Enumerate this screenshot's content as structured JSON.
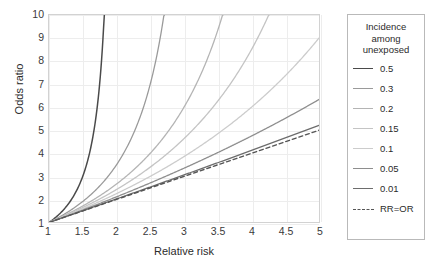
{
  "chart_data": {
    "type": "line",
    "title": "",
    "xlabel": "Relative risk",
    "ylabel": "Odds ratio",
    "xlim": [
      1,
      5
    ],
    "ylim": [
      1,
      10
    ],
    "xticks": [
      "1",
      "1.5",
      "2",
      "2.5",
      "3",
      "3.5",
      "4",
      "4.5",
      "5"
    ],
    "xtick_values": [
      1,
      1.5,
      2,
      2.5,
      3,
      3.5,
      4,
      4.5,
      5
    ],
    "yticks": [
      "1",
      "2",
      "3",
      "4",
      "5",
      "6",
      "7",
      "8",
      "9",
      "10"
    ],
    "ytick_values": [
      1,
      2,
      3,
      4,
      5,
      6,
      7,
      8,
      9,
      10
    ],
    "grid": true,
    "legend_position": "right-outside",
    "legend_title": [
      "Incidence",
      "among",
      "unexposed"
    ],
    "formula": "OR = RR(1 - p0) / (1 - RR*p0)",
    "series": [
      {
        "name": "0.5",
        "p0": 0.5,
        "color": "#4a4a4a",
        "width": 1.5,
        "dash": false,
        "x": [
          1,
          1.1,
          1.2,
          1.3,
          1.4,
          1.5,
          1.6,
          1.7,
          1.75,
          1.8,
          1.8182
        ],
        "y": [
          1,
          1.222,
          1.5,
          1.857,
          2.333,
          3,
          4,
          5.667,
          7,
          9,
          10
        ]
      },
      {
        "name": "0.3",
        "p0": 0.3,
        "color": "#9a9a9a",
        "width": 1.3,
        "dash": false,
        "x": [
          1,
          1.25,
          1.5,
          1.75,
          2,
          2.25,
          2.5,
          2.6,
          2.7027
        ],
        "y": [
          1,
          1.4,
          1.909,
          2.577,
          3.5,
          4.846,
          7,
          8.27,
          10
        ]
      },
      {
        "name": "0.2",
        "p0": 0.2,
        "color": "#b4b4b4",
        "width": 1.3,
        "dash": false,
        "x": [
          1,
          1.5,
          2,
          2.5,
          3,
          3.25,
          3.5,
          3.5714
        ],
        "y": [
          1,
          1.714,
          2.667,
          4,
          6,
          7.429,
          9.333,
          10
        ]
      },
      {
        "name": "0.15",
        "p0": 0.15,
        "color": "#c4c4c4",
        "width": 1.3,
        "dash": false,
        "x": [
          1,
          1.5,
          2,
          2.5,
          3,
          3.5,
          4,
          4.1,
          4.2105
        ],
        "y": [
          1,
          1.632,
          2.429,
          3.474,
          4.909,
          7,
          10,
          10.8,
          10
        ]
      },
      {
        "name": "0.1",
        "p0": 0.1,
        "color": "#cccccc",
        "width": 1.3,
        "dash": false,
        "x": [
          1,
          1.5,
          2,
          2.5,
          3,
          3.5,
          4,
          4.5,
          5
        ],
        "y": [
          1,
          1.588,
          2.25,
          3,
          3.857,
          4.846,
          6,
          7.364,
          9
        ]
      },
      {
        "name": "0.05",
        "p0": 0.05,
        "color": "#8e8e8e",
        "width": 1.3,
        "dash": false,
        "x": [
          1,
          1.5,
          2,
          2.5,
          3,
          3.5,
          4,
          4.5,
          5
        ],
        "y": [
          1,
          1.541,
          2.111,
          2.714,
          3.353,
          4.032,
          4.75,
          5.516,
          6.333
        ]
      },
      {
        "name": "0.01",
        "p0": 0.01,
        "color": "#6d6d6d",
        "width": 1.3,
        "dash": false,
        "x": [
          1,
          1.5,
          2,
          2.5,
          3,
          3.5,
          4,
          4.5,
          5
        ],
        "y": [
          1,
          1.508,
          2.02,
          2.538,
          3.061,
          3.591,
          4.125,
          4.665,
          5.211
        ]
      },
      {
        "name": "RR=OR",
        "p0": null,
        "color": "#555555",
        "width": 1.4,
        "dash": true,
        "x": [
          1,
          5
        ],
        "y": [
          1,
          5
        ]
      }
    ]
  }
}
